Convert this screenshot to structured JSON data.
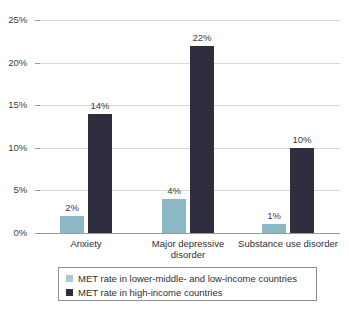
{
  "chart_data": {
    "type": "bar",
    "title": "",
    "subtitle": "",
    "xlabel": "",
    "ylabel": "",
    "ylim": [
      0,
      25
    ],
    "ytick_labels": [
      "0%",
      "5%",
      "10%",
      "15%",
      "20%",
      "25%"
    ],
    "ytick_values": [
      0,
      5,
      10,
      15,
      20,
      25
    ],
    "grid": true,
    "legend_position": "bottom",
    "categories": [
      "Anxiety",
      "Major depressive\ndisorder",
      "Substance use disorder"
    ],
    "series": [
      {
        "name": "MET rate in lower-middle- and low-income countries",
        "color": "#8cb8c6",
        "values": [
          2,
          4,
          1
        ],
        "value_labels": [
          "2%",
          "4%",
          "1%"
        ]
      },
      {
        "name": "MET rate in high-income countries",
        "color": "#2e2e3f",
        "values": [
          14,
          22,
          10
        ],
        "value_labels": [
          "14%",
          "22%",
          "10%"
        ]
      }
    ]
  },
  "colors": {
    "series_low": "#8cb8c6",
    "series_high": "#2e2e3f",
    "gridline": "#d8d8d8",
    "axis": "#9a9a9a",
    "text": "#3d3d3d",
    "background": "#ffffff",
    "legend_border": "#8e8e8e"
  },
  "legend": {
    "items": [
      {
        "label": "MET rate in lower-middle- and low-income countries",
        "swatch": "series-low"
      },
      {
        "label": "MET rate in high-income countries",
        "swatch": "series-high"
      }
    ]
  }
}
